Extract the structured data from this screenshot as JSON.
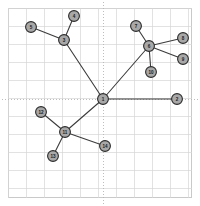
{
  "figure": {
    "type": "node-link-graph",
    "background_color": "#ffffff",
    "width": 200,
    "height": 206
  },
  "plot_area": {
    "x": 8,
    "y": 8,
    "width": 184,
    "height": 190,
    "frame_color": "#c9c9c9",
    "frame_width": 1
  },
  "grid": {
    "visible": true,
    "color": "#d6d6d6",
    "line_width": 0.7,
    "x_positions": [
      8,
      26,
      44,
      62,
      80,
      98,
      116,
      134,
      152,
      170,
      188
    ],
    "y_positions": [
      8,
      26,
      44,
      62,
      80,
      98,
      116,
      134,
      152,
      170,
      188
    ]
  },
  "axes_dotted": {
    "visible": true,
    "color": "#b5b5b5",
    "dash": "1,2",
    "vertical_x": 103,
    "horizontal_y": 99
  },
  "edge_style": {
    "color": "#3c3c3c",
    "width": 1.1
  },
  "node_style": {
    "radius": 5.4,
    "fill_color": "#a8a8a8",
    "stroke_color": "#2b2b2b",
    "stroke_width": 1.1,
    "label_color": "#1a1a1a",
    "label_font_size": 4.6
  },
  "chart_data": {
    "type": "graph",
    "title": "",
    "xlabel": "",
    "ylabel": "",
    "node_count": 14,
    "edge_count": 13,
    "nodes": [
      {
        "id": "1",
        "label": "1",
        "x": 103,
        "y": 99,
        "degree": 4
      },
      {
        "id": "2",
        "label": "2",
        "x": 177,
        "y": 99,
        "degree": 1
      },
      {
        "id": "3",
        "label": "3",
        "x": 64,
        "y": 40,
        "degree": 3
      },
      {
        "id": "4",
        "label": "4",
        "x": 74,
        "y": 16,
        "degree": 1
      },
      {
        "id": "5",
        "label": "5",
        "x": 31,
        "y": 27,
        "degree": 1
      },
      {
        "id": "6",
        "label": "6",
        "x": 149,
        "y": 46,
        "degree": 5
      },
      {
        "id": "7",
        "label": "7",
        "x": 136,
        "y": 26,
        "degree": 1
      },
      {
        "id": "8",
        "label": "8",
        "x": 183,
        "y": 38,
        "degree": 1
      },
      {
        "id": "9",
        "label": "9",
        "x": 183,
        "y": 59,
        "degree": 1
      },
      {
        "id": "10",
        "label": "10",
        "x": 151,
        "y": 72,
        "degree": 1
      },
      {
        "id": "11",
        "label": "11",
        "x": 65,
        "y": 132,
        "degree": 4
      },
      {
        "id": "12",
        "label": "12",
        "x": 41,
        "y": 112,
        "degree": 1
      },
      {
        "id": "13",
        "label": "13",
        "x": 53,
        "y": 156,
        "degree": 1
      },
      {
        "id": "14",
        "label": "14",
        "x": 105,
        "y": 146,
        "degree": 1
      }
    ],
    "edges": [
      {
        "source": "1",
        "target": "2"
      },
      {
        "source": "1",
        "target": "3"
      },
      {
        "source": "1",
        "target": "6"
      },
      {
        "source": "1",
        "target": "11"
      },
      {
        "source": "3",
        "target": "4"
      },
      {
        "source": "3",
        "target": "5"
      },
      {
        "source": "6",
        "target": "7"
      },
      {
        "source": "6",
        "target": "8"
      },
      {
        "source": "6",
        "target": "9"
      },
      {
        "source": "6",
        "target": "10"
      },
      {
        "source": "11",
        "target": "12"
      },
      {
        "source": "11",
        "target": "13"
      },
      {
        "source": "11",
        "target": "14"
      }
    ]
  }
}
